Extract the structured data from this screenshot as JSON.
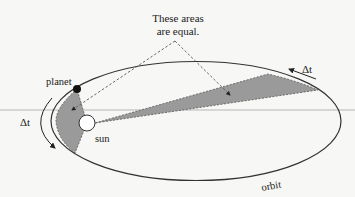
{
  "diagram": {
    "callout": {
      "line1": "These areas",
      "line2": "are equal."
    },
    "labels": {
      "planet": "planet",
      "sun": "sun",
      "orbit": "orbit",
      "delta_t_left": "Δt",
      "delta_t_right": "Δt"
    },
    "colors": {
      "background": "#f7f7f5",
      "shaded_area": "#9a9a9a",
      "orbit_line": "#333333",
      "guide_line": "#b5b5b5",
      "planet": "#111111",
      "sun_fill": "#ffffff"
    }
  }
}
